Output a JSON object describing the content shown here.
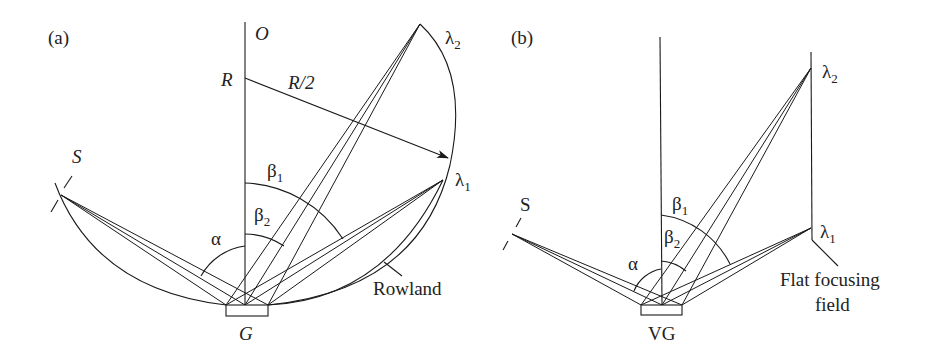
{
  "panel_a": {
    "tag": "(a)",
    "label_O": "O",
    "label_R": "R",
    "label_R_half": "R/2",
    "label_S": "S",
    "label_G": "G",
    "label_alpha": "α",
    "label_beta1": "β",
    "label_beta1_sub": "1",
    "label_beta2": "β",
    "label_beta2_sub": "2",
    "label_lambda1": "λ",
    "label_lambda1_sub": "1",
    "label_lambda2": "λ",
    "label_lambda2_sub": "2",
    "label_rowland": "Rowland"
  },
  "panel_b": {
    "tag": "(b)",
    "label_S": "S",
    "label_VG": "VG",
    "label_alpha": "α",
    "label_beta1": "β",
    "label_beta1_sub": "1",
    "label_beta2": "β",
    "label_beta2_sub": "2",
    "label_lambda1": "λ",
    "label_lambda1_sub": "1",
    "label_lambda2": "λ",
    "label_lambda2_sub": "2",
    "label_flat_line1": "Flat focusing",
    "label_flat_line2": "field"
  }
}
